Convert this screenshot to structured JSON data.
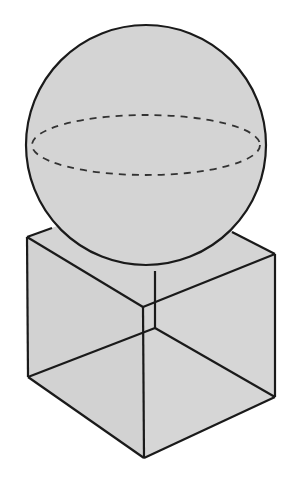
{
  "diagram": {
    "title": "",
    "colors": {
      "background": "#ffffff",
      "fill": "#d4d4d4",
      "stroke": "#1a1a1a",
      "dashed": "#333333"
    },
    "sphere": {
      "cx": 146,
      "cy": 145,
      "r": 120,
      "equator": {
        "cx": 146,
        "cy": 145,
        "rx": 114,
        "ry": 30,
        "style": "dashed"
      }
    },
    "cube": {
      "top_left": [
        27,
        237
      ],
      "top_back": [
        156,
        190
      ],
      "top_right": [
        275,
        254
      ],
      "top_front": [
        143,
        307
      ],
      "bottom_left": [
        28,
        377
      ],
      "bottom_front": [
        144,
        458
      ],
      "bottom_right": [
        275,
        397
      ],
      "bottom_back": [
        155,
        328
      ]
    }
  }
}
